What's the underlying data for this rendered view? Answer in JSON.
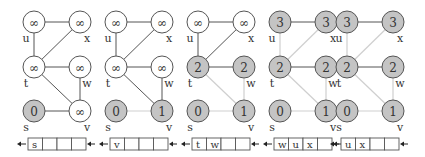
{
  "colors": {
    "edge_dark": "#555555",
    "edge_light": "#cfcfcf",
    "node_white": "#ffffff",
    "node_gray": "#c4c4c4",
    "stroke": "#555555",
    "text": "#333333"
  },
  "graph": {
    "nodes": [
      {
        "id": "u",
        "col": 0,
        "row": 0,
        "label_pos": "bl"
      },
      {
        "id": "x",
        "col": 1,
        "row": 0,
        "label_pos": "br"
      },
      {
        "id": "t",
        "col": 0,
        "row": 1,
        "label_pos": "bl"
      },
      {
        "id": "w",
        "col": 1,
        "row": 1,
        "label_pos": "br"
      },
      {
        "id": "s",
        "col": 0,
        "row": 2,
        "label_pos": "bl"
      },
      {
        "id": "v",
        "col": 1,
        "row": 2,
        "label_pos": "br"
      }
    ],
    "edges": [
      [
        "u",
        "x"
      ],
      [
        "u",
        "t"
      ],
      [
        "t",
        "x"
      ],
      [
        "t",
        "w"
      ],
      [
        "t",
        "v"
      ],
      [
        "w",
        "v"
      ],
      [
        "s",
        "v"
      ]
    ]
  },
  "panels": [
    {
      "name": "step-1",
      "values": {
        "u": "∞",
        "x": "∞",
        "t": "∞",
        "w": "∞",
        "s": "0",
        "v": "∞"
      },
      "gray": [
        "s"
      ],
      "light_edges": [],
      "queue": [
        "s",
        "",
        "",
        ""
      ]
    },
    {
      "name": "step-2",
      "values": {
        "u": "∞",
        "x": "∞",
        "t": "∞",
        "w": "∞",
        "s": "0",
        "v": "1"
      },
      "gray": [
        "s",
        "v"
      ],
      "light_edges": [
        [
          "s",
          "v"
        ]
      ],
      "queue": [
        "v",
        "",
        "",
        ""
      ]
    },
    {
      "name": "step-3",
      "values": {
        "u": "∞",
        "x": "∞",
        "t": "2",
        "w": "2",
        "s": "0",
        "v": "1"
      },
      "gray": [
        "s",
        "v",
        "t",
        "w"
      ],
      "light_edges": [
        [
          "s",
          "v"
        ],
        [
          "t",
          "v"
        ],
        [
          "w",
          "v"
        ]
      ],
      "queue": [
        "t",
        "w",
        "",
        ""
      ]
    },
    {
      "name": "step-4",
      "values": {
        "u": "3",
        "x": "3",
        "t": "2",
        "w": "2",
        "s": "0",
        "v": "1"
      },
      "gray": [
        "s",
        "v",
        "t",
        "w",
        "u",
        "x"
      ],
      "light_edges": [
        [
          "s",
          "v"
        ],
        [
          "t",
          "v"
        ],
        [
          "w",
          "v"
        ],
        [
          "u",
          "t"
        ],
        [
          "t",
          "x"
        ]
      ],
      "queue": [
        "w",
        "u",
        "x",
        ""
      ]
    },
    {
      "name": "step-5",
      "values": {
        "u": "3",
        "x": "3",
        "t": "2",
        "w": "2",
        "s": "0",
        "v": "1"
      },
      "gray": [
        "s",
        "v",
        "t",
        "w",
        "u",
        "x"
      ],
      "light_edges": [
        [
          "s",
          "v"
        ],
        [
          "t",
          "v"
        ],
        [
          "w",
          "v"
        ],
        [
          "u",
          "t"
        ],
        [
          "t",
          "x"
        ]
      ],
      "queue": [
        "u",
        "x",
        "",
        ""
      ]
    }
  ]
}
